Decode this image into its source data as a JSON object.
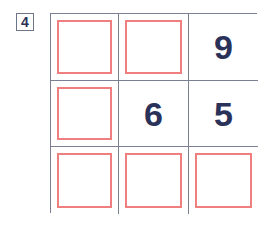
{
  "puzzle": {
    "index_label": "4",
    "colors": {
      "grid_line": "#7a8091",
      "digit": "#2b3259",
      "empty_marker": "#ef7f7f",
      "background": "#ffffff",
      "label_border": "#6d7488"
    },
    "grid": {
      "rows": 3,
      "columns": 3,
      "cells": [
        {
          "row": 1,
          "col": 1,
          "value": "",
          "state": "empty"
        },
        {
          "row": 1,
          "col": 2,
          "value": "",
          "state": "empty"
        },
        {
          "row": 1,
          "col": 3,
          "value": "9",
          "state": "filled"
        },
        {
          "row": 2,
          "col": 1,
          "value": "",
          "state": "empty"
        },
        {
          "row": 2,
          "col": 2,
          "value": "6",
          "state": "filled"
        },
        {
          "row": 2,
          "col": 3,
          "value": "5",
          "state": "filled"
        },
        {
          "row": 3,
          "col": 1,
          "value": "",
          "state": "empty"
        },
        {
          "row": 3,
          "col": 2,
          "value": "",
          "state": "empty"
        },
        {
          "row": 3,
          "col": 3,
          "value": "",
          "state": "empty"
        }
      ]
    }
  }
}
